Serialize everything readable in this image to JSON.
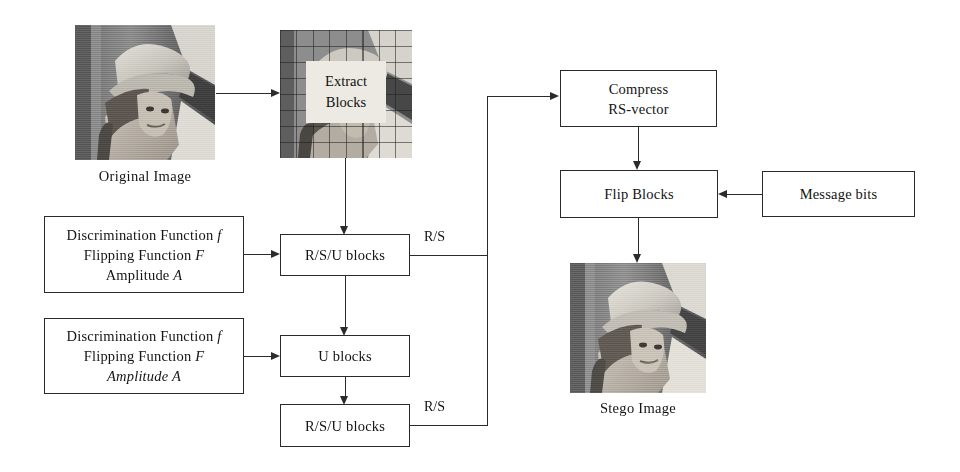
{
  "diagram": {
    "stroke_color": "#2b2b2b",
    "background": "#ffffff"
  },
  "images": {
    "original": {
      "caption": "Original Image",
      "alt": "Lena grayscale photograph"
    },
    "blocked": {
      "alt": "Lena grayscale photograph overlaid with a block grid",
      "inset_line1": "Extract",
      "inset_line2": "Blocks"
    },
    "stego": {
      "caption": "Stego Image",
      "alt": "Lena grayscale photograph after embedding"
    }
  },
  "boxes": {
    "params_top": {
      "line1_pre": "Discrimination Function ",
      "line1_sym": "f",
      "line2_pre": "Flipping Function ",
      "line2_sym": "F",
      "line3_pre": "Amplitude ",
      "line3_sym": "A"
    },
    "params_bottom": {
      "line1_pre": "Discrimination Function ",
      "line1_sym": "f",
      "line2_pre": "Flipping Function ",
      "line2_sym": "F",
      "line3_italic": "Amplitude A"
    },
    "rsu_blocks_top": {
      "label": "R/S/U blocks"
    },
    "u_blocks": {
      "label": "U blocks"
    },
    "rsu_blocks_bottom": {
      "label": "R/S/U blocks"
    },
    "compress": {
      "line1": "Compress",
      "line2": "RS-vector"
    },
    "flip_blocks": {
      "label": "Flip Blocks"
    },
    "message_bits": {
      "label": "Message bits"
    }
  },
  "edge_labels": {
    "rs_top": "R/S",
    "rs_bottom": "R/S"
  }
}
